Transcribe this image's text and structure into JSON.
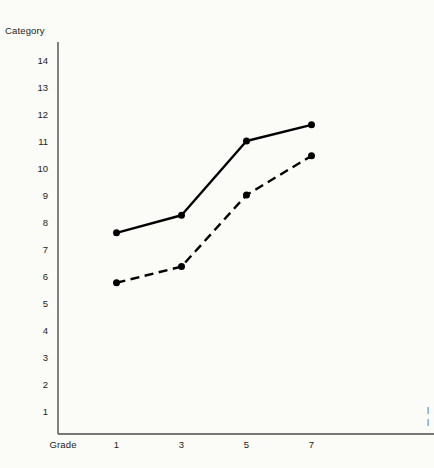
{
  "chart_data": {
    "type": "line",
    "title": "",
    "xlabel": "Grade",
    "ylabel": "Category",
    "x": [
      1,
      3,
      5,
      7
    ],
    "categories": [
      "1",
      "3",
      "5",
      "7"
    ],
    "xtick_labels": [
      "1",
      "3",
      "5",
      "7"
    ],
    "ytick_labels": [
      "14",
      "13",
      "12",
      "11",
      "10",
      "9",
      "8",
      "7",
      "6",
      "5",
      "4",
      "3",
      "2",
      "1"
    ],
    "ytick_values": [
      14,
      13,
      12,
      11,
      10,
      9,
      8,
      7,
      6,
      5,
      4,
      3,
      2,
      1
    ],
    "ylim": [
      0,
      14.6
    ],
    "xlim": [
      0,
      8.6
    ],
    "grid": false,
    "legend": "none",
    "series": [
      {
        "name": "solid-series",
        "style": "solid",
        "color": "#000000",
        "marker": "filled-circle",
        "values": [
          7.6,
          8.25,
          11.0,
          11.6
        ]
      },
      {
        "name": "dashed-series",
        "style": "dashed",
        "color": "#000000",
        "marker": "filled-circle",
        "values": [
          5.75,
          6.35,
          9.0,
          10.45
        ]
      }
    ]
  },
  "axes": {
    "y_axis_title": "Category",
    "x_axis_title": "Grade"
  },
  "edge_marks": {
    "top": "|",
    "bottom": "|"
  },
  "colors": {
    "background": "#fbfbf7",
    "axis": "#4d4d4d",
    "ink": "#000000",
    "text": "#1c1c1c"
  }
}
